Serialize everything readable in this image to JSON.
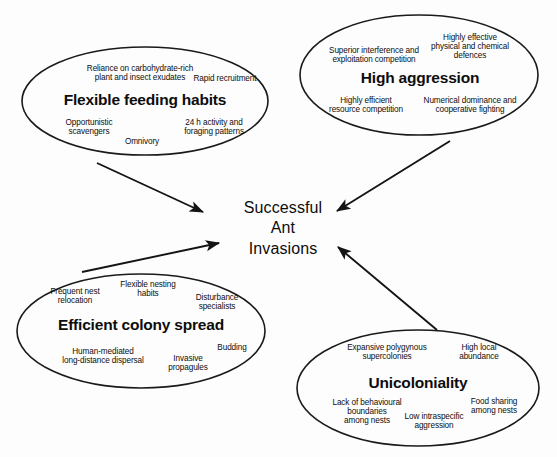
{
  "diagram": {
    "center": {
      "label": "Successful\nAnt\nInvasions",
      "line1": "Successful",
      "line2": "Ant",
      "line3": "Invasions"
    },
    "style": {
      "background": "#fdfdfd",
      "stroke": "#1a1a1a",
      "text": "#0d0d0d"
    },
    "nodes": [
      {
        "id": "flexible-feeding-habits",
        "title": "Flexible feeding habits",
        "attributes": [
          "Reliance on carbohydrate-rich\nplant and insect exudates",
          "Rapid recruitment",
          "Opportunistic\nscavengers",
          "Omnivory",
          "24 h activity and\nforaging patterns"
        ]
      },
      {
        "id": "high-aggression",
        "title": "High aggression",
        "attributes": [
          "Superior interference and\nexploitation competition",
          "Highly effective\nphysical and chemical\ndefences",
          "Highly efficient\nresource competition",
          "Numerical dominance and\ncooperative fighting"
        ]
      },
      {
        "id": "efficient-colony-spread",
        "title": "Efficient colony spread",
        "attributes": [
          "Frequent nest\nrelocation",
          "Flexible nesting\nhabits",
          "Disturbance\nspecialists",
          "Human-mediated\nlong-distance dispersal",
          "Invasive\npropagules",
          "Budding"
        ]
      },
      {
        "id": "unicoloniality",
        "title": "Unicoloniality",
        "attributes": [
          "Expansive polygynous\nsupercolonies",
          "High local\nabundance",
          "Lack of behavioural\nboundaries\namong nests",
          "Low intraspecific\naggression",
          "Food sharing\namong nests"
        ]
      }
    ],
    "arrows": [
      {
        "id": "arrow-feeding-to-center",
        "from": "flexible-feeding-habits",
        "to": "center"
      },
      {
        "id": "arrow-aggression-to-center",
        "from": "high-aggression",
        "to": "center"
      },
      {
        "id": "arrow-colony-to-center",
        "from": "efficient-colony-spread",
        "to": "center"
      },
      {
        "id": "arrow-unicoloniality-to-center",
        "from": "unicoloniality",
        "to": "center"
      }
    ]
  }
}
